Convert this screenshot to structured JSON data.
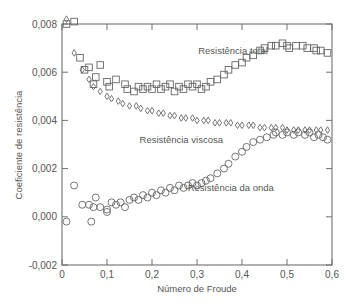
{
  "chart_data": {
    "type": "scatter",
    "title": "",
    "xlabel": "Número de Froude",
    "ylabel": "Coeficiente de resistência",
    "xlim": [
      0,
      0.6
    ],
    "ylim": [
      -0.002,
      0.008
    ],
    "grid": false,
    "legend": "none (inline annotations)",
    "x_ticks": [
      0,
      0.1,
      0.2,
      0.3,
      0.4,
      0.5,
      0.6
    ],
    "x_tick_labels": [
      "0",
      "0,1",
      "0,2",
      "0,3",
      "0,4",
      "0,5",
      "0,6"
    ],
    "y_ticks": [
      -0.002,
      0.0,
      0.002,
      0.004,
      0.006,
      0.008
    ],
    "y_tick_labels": [
      "-0,002",
      "0,000",
      "0,002",
      "0,004",
      "0,006",
      "0,008"
    ],
    "annotations": [
      {
        "text": "Resistência total",
        "x": 0.38,
        "y": 0.0069
      },
      {
        "text": "Resistência viscosa",
        "x": 0.265,
        "y": 0.0032
      },
      {
        "text": "Resistência da onda",
        "x": 0.375,
        "y": 0.0012
      }
    ],
    "series": [
      {
        "name": "Resistência total",
        "marker": "square",
        "points": [
          [
            0.01,
            0.008
          ],
          [
            0.027,
            0.0081
          ],
          [
            0.04,
            0.0066
          ],
          [
            0.05,
            0.0061
          ],
          [
            0.06,
            0.0062
          ],
          [
            0.07,
            0.0055
          ],
          [
            0.075,
            0.0058
          ],
          [
            0.085,
            0.0063
          ],
          [
            0.1,
            0.0056
          ],
          [
            0.105,
            0.0054
          ],
          [
            0.12,
            0.0057
          ],
          [
            0.14,
            0.0055
          ],
          [
            0.145,
            0.0053
          ],
          [
            0.16,
            0.0052
          ],
          [
            0.17,
            0.0054
          ],
          [
            0.18,
            0.0053
          ],
          [
            0.19,
            0.0054
          ],
          [
            0.2,
            0.0053
          ],
          [
            0.21,
            0.0055
          ],
          [
            0.22,
            0.0053
          ],
          [
            0.23,
            0.0054
          ],
          [
            0.24,
            0.0055
          ],
          [
            0.25,
            0.0052
          ],
          [
            0.26,
            0.0054
          ],
          [
            0.27,
            0.0053
          ],
          [
            0.28,
            0.0055
          ],
          [
            0.29,
            0.0054
          ],
          [
            0.3,
            0.0055
          ],
          [
            0.31,
            0.0053
          ],
          [
            0.32,
            0.0054
          ],
          [
            0.33,
            0.0056
          ],
          [
            0.345,
            0.0057
          ],
          [
            0.36,
            0.0059
          ],
          [
            0.37,
            0.0061
          ],
          [
            0.385,
            0.0063
          ],
          [
            0.4,
            0.0064
          ],
          [
            0.41,
            0.0066
          ],
          [
            0.425,
            0.0067
          ],
          [
            0.44,
            0.0069
          ],
          [
            0.45,
            0.007
          ],
          [
            0.465,
            0.0071
          ],
          [
            0.475,
            0.0071
          ],
          [
            0.49,
            0.0072
          ],
          [
            0.5,
            0.0071
          ],
          [
            0.505,
            0.007
          ],
          [
            0.52,
            0.0071
          ],
          [
            0.535,
            0.0071
          ],
          [
            0.545,
            0.007
          ],
          [
            0.56,
            0.007
          ],
          [
            0.565,
            0.0069
          ],
          [
            0.575,
            0.0069
          ],
          [
            0.59,
            0.0068
          ]
        ]
      },
      {
        "name": "Resistência viscosa",
        "marker": "diamond",
        "points": [
          [
            0.01,
            0.0082
          ],
          [
            0.027,
            0.0068
          ],
          [
            0.045,
            0.0061
          ],
          [
            0.06,
            0.0057
          ],
          [
            0.07,
            0.0054
          ],
          [
            0.085,
            0.0052
          ],
          [
            0.1,
            0.005
          ],
          [
            0.11,
            0.0049
          ],
          [
            0.125,
            0.0048
          ],
          [
            0.135,
            0.0047
          ],
          [
            0.15,
            0.0046
          ],
          [
            0.165,
            0.0046
          ],
          [
            0.175,
            0.0045
          ],
          [
            0.19,
            0.0044
          ],
          [
            0.2,
            0.0044
          ],
          [
            0.215,
            0.0043
          ],
          [
            0.225,
            0.0043
          ],
          [
            0.24,
            0.0042
          ],
          [
            0.25,
            0.0042
          ],
          [
            0.265,
            0.0041
          ],
          [
            0.275,
            0.0041
          ],
          [
            0.29,
            0.0041
          ],
          [
            0.3,
            0.004
          ],
          [
            0.315,
            0.004
          ],
          [
            0.325,
            0.004
          ],
          [
            0.34,
            0.0039
          ],
          [
            0.35,
            0.0039
          ],
          [
            0.365,
            0.0039
          ],
          [
            0.375,
            0.0039
          ],
          [
            0.39,
            0.0038
          ],
          [
            0.4,
            0.0038
          ],
          [
            0.415,
            0.0038
          ],
          [
            0.425,
            0.0038
          ],
          [
            0.44,
            0.0037
          ],
          [
            0.45,
            0.0037
          ],
          [
            0.465,
            0.0037
          ],
          [
            0.475,
            0.0037
          ],
          [
            0.49,
            0.0037
          ],
          [
            0.5,
            0.0036
          ],
          [
            0.515,
            0.0036
          ],
          [
            0.525,
            0.0036
          ],
          [
            0.54,
            0.0036
          ],
          [
            0.55,
            0.0036
          ],
          [
            0.565,
            0.0036
          ],
          [
            0.575,
            0.0036
          ],
          [
            0.59,
            0.0036
          ]
        ]
      },
      {
        "name": "Resistência da onda",
        "marker": "circle",
        "points": [
          [
            0.01,
            -0.0002
          ],
          [
            0.027,
            0.0013
          ],
          [
            0.045,
            0.0005
          ],
          [
            0.06,
            0.0005
          ],
          [
            0.065,
            -0.0002
          ],
          [
            0.07,
            0.0004
          ],
          [
            0.075,
            0.0008
          ],
          [
            0.085,
            0.0004
          ],
          [
            0.1,
            0.0003
          ],
          [
            0.1,
            0.0002
          ],
          [
            0.11,
            0.0006
          ],
          [
            0.12,
            0.0005
          ],
          [
            0.13,
            0.0006
          ],
          [
            0.14,
            0.0004
          ],
          [
            0.15,
            0.0007
          ],
          [
            0.16,
            0.0008
          ],
          [
            0.17,
            0.0007
          ],
          [
            0.18,
            0.0009
          ],
          [
            0.19,
            0.0008
          ],
          [
            0.2,
            0.001
          ],
          [
            0.21,
            0.0009
          ],
          [
            0.22,
            0.0011
          ],
          [
            0.23,
            0.001
          ],
          [
            0.24,
            0.0012
          ],
          [
            0.25,
            0.0011
          ],
          [
            0.26,
            0.0013
          ],
          [
            0.27,
            0.0012
          ],
          [
            0.28,
            0.0013
          ],
          [
            0.29,
            0.0014
          ],
          [
            0.3,
            0.0013
          ],
          [
            0.31,
            0.0014
          ],
          [
            0.32,
            0.0015
          ],
          [
            0.33,
            0.0016
          ],
          [
            0.345,
            0.0018
          ],
          [
            0.36,
            0.002
          ],
          [
            0.37,
            0.0022
          ],
          [
            0.385,
            0.0025
          ],
          [
            0.4,
            0.0027
          ],
          [
            0.41,
            0.0029
          ],
          [
            0.425,
            0.0031
          ],
          [
            0.44,
            0.0032
          ],
          [
            0.455,
            0.0033
          ],
          [
            0.47,
            0.0034
          ],
          [
            0.475,
            0.0035
          ],
          [
            0.49,
            0.0034
          ],
          [
            0.5,
            0.0035
          ],
          [
            0.515,
            0.0034
          ],
          [
            0.525,
            0.0035
          ],
          [
            0.54,
            0.0034
          ],
          [
            0.55,
            0.0035
          ],
          [
            0.56,
            0.0033
          ],
          [
            0.57,
            0.0034
          ],
          [
            0.58,
            0.0033
          ],
          [
            0.59,
            0.0032
          ]
        ]
      }
    ]
  }
}
